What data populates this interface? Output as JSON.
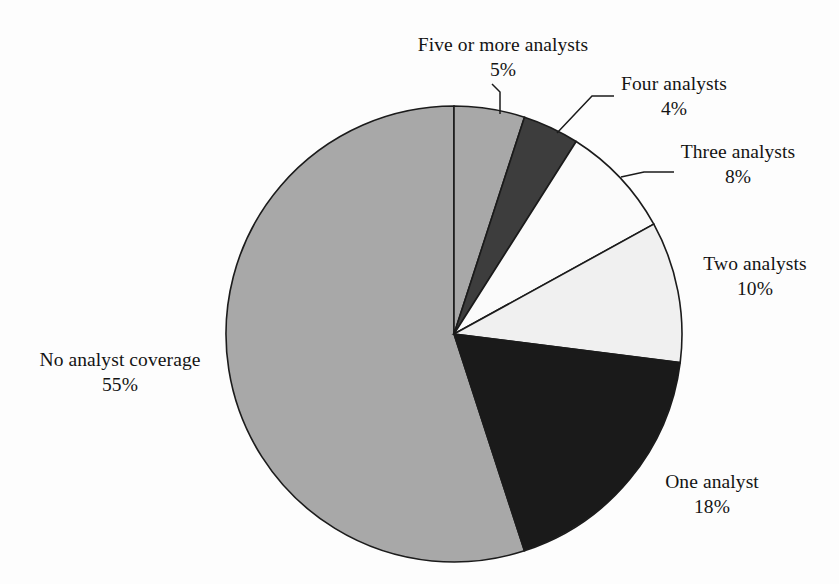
{
  "chart_data": {
    "type": "pie",
    "title": "",
    "subtitle": "",
    "xlabel": "",
    "ylabel": "",
    "legend_position": "none",
    "grid": false,
    "units": "percent",
    "start_angle_deg": 0,
    "direction": "clockwise",
    "categories": [
      "Five or more analysts",
      "Four analysts",
      "Three analysts",
      "Two analysts",
      "One analyst",
      "No analyst coverage"
    ],
    "values": [
      5,
      4,
      8,
      10,
      18,
      55
    ],
    "value_labels": [
      "5%",
      "4%",
      "8%",
      "10%",
      "18%",
      "55%"
    ],
    "colors": [
      "#a8a8a8",
      "#3d3d3d",
      "#fbfbfb",
      "#f0f0f0",
      "#1a1a1a",
      "#a8a8a8"
    ],
    "slices": [
      {
        "label": "Five or more analysts",
        "value": 5,
        "value_label": "5%",
        "color": "#a8a8a8",
        "has_leader_line": true
      },
      {
        "label": "Four analysts",
        "value": 4,
        "value_label": "4%",
        "color": "#3d3d3d",
        "has_leader_line": true
      },
      {
        "label": "Three analysts",
        "value": 8,
        "value_label": "8%",
        "color": "#fbfbfb",
        "has_leader_line": true
      },
      {
        "label": "Two analysts",
        "value": 10,
        "value_label": "10%",
        "color": "#f0f0f0",
        "has_leader_line": false
      },
      {
        "label": "One analyst",
        "value": 18,
        "value_label": "18%",
        "color": "#1a1a1a",
        "has_leader_line": false
      },
      {
        "label": "No analyst coverage",
        "value": 55,
        "value_label": "55%",
        "color": "#a8a8a8",
        "has_leader_line": false
      }
    ]
  },
  "figure": {
    "background_color": "#fdfdfd",
    "outline_color": "#1b1b1b",
    "labels": {
      "five": {
        "name": "Five or more analysts",
        "pct": "5%"
      },
      "four": {
        "name": "Four analysts",
        "pct": "4%"
      },
      "three": {
        "name": "Three analysts",
        "pct": "8%"
      },
      "two": {
        "name": "Two analysts",
        "pct": "10%"
      },
      "one": {
        "name": "One analyst",
        "pct": "18%"
      },
      "none": {
        "name": "No analyst coverage",
        "pct": "55%"
      }
    }
  }
}
